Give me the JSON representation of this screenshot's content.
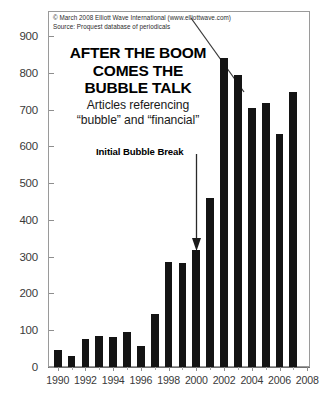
{
  "credit": {
    "line1": "© March 2008 Elliott Wave International (www.elliottwave.com)",
    "line2": "Source: Proquest database of periodicals"
  },
  "title": {
    "line1": "AFTER THE BOOM",
    "line2": "COMES THE",
    "line3": "BUBBLE TALK",
    "sub1": "Articles referencing",
    "sub2": "“bubble” and “financial”"
  },
  "annotation": {
    "label": "Initial Bubble Break",
    "points_to_year": 2000
  },
  "colors": {
    "bar": "#141414",
    "frame": "#9a9a9a",
    "axis": "#8e8e8e",
    "text": "#1a1a1a",
    "trendline": "#3a3a3a"
  },
  "chart_data": {
    "type": "bar",
    "title": "AFTER THE BOOM COMES THE BUBBLE TALK",
    "subtitle": "Articles referencing “bubble” and “financial”",
    "xlabel": "",
    "ylabel": "",
    "grid": false,
    "legend": "none",
    "ylim": [
      0,
      900
    ],
    "ytick_labels": [
      "0",
      "100",
      "200",
      "300",
      "400",
      "500",
      "600",
      "700",
      "800",
      "900"
    ],
    "yticks": [
      0,
      100,
      200,
      300,
      400,
      500,
      600,
      700,
      800,
      900
    ],
    "xlim": [
      1989.3,
      2008.2
    ],
    "xtick_labels": [
      "1990",
      "1992",
      "1994",
      "1996",
      "1998",
      "2000",
      "2002",
      "2004",
      "2006",
      "2008"
    ],
    "xticks": [
      1990,
      1992,
      1994,
      1996,
      1998,
      2000,
      2002,
      2004,
      2006,
      2008
    ],
    "categories": [
      1990,
      1991,
      1992,
      1993,
      1994,
      1995,
      1996,
      1997,
      1998,
      1999,
      2000,
      2001,
      2002,
      2003,
      2004,
      2005,
      2006,
      2007
    ],
    "values": [
      45,
      30,
      75,
      83,
      82,
      95,
      58,
      143,
      285,
      283,
      318,
      460,
      840,
      795,
      705,
      718,
      635,
      748
    ],
    "annotations": [
      {
        "text": "Initial Bubble Break",
        "target_x": 2000,
        "target_y": 318,
        "type": "arrow"
      },
      {
        "text": "",
        "type": "trendline",
        "from": [
          2001.6,
          880
        ],
        "to": [
          2005.4,
          690
        ]
      }
    ]
  }
}
